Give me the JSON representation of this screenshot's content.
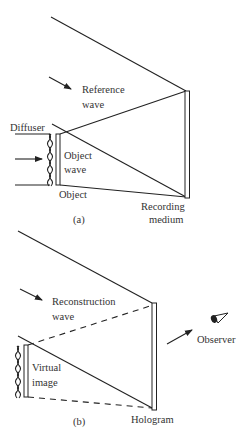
{
  "figure": {
    "panel_a": {
      "caption": "(a)",
      "labels": {
        "reference_wave_line1": "Reference",
        "reference_wave_line2": "wave",
        "diffuser": "Diffuser",
        "object_wave_line1": "Object",
        "object_wave_line2": "wave",
        "object": "Object",
        "recording_medium_line1": "Recording",
        "recording_medium_line2": "medium"
      }
    },
    "panel_b": {
      "caption": "(b)",
      "labels": {
        "reconstruction_wave_line1": "Reconstruction",
        "reconstruction_wave_line2": "wave",
        "virtual_image_line1": "Virtual",
        "virtual_image_line2": "image",
        "hologram": "Hologram",
        "observer": "Observer"
      }
    },
    "colors": {
      "line": "#222222",
      "text": "#333333",
      "background": "#ffffff"
    }
  }
}
